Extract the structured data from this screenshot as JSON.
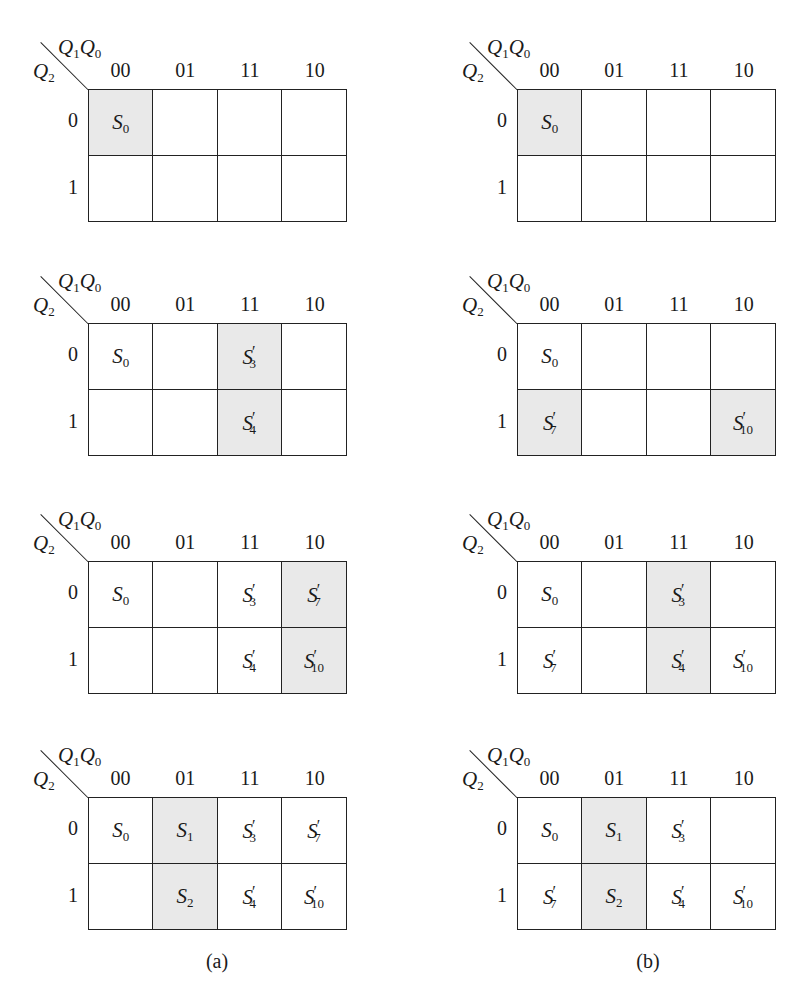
{
  "figure": {
    "column_variable": {
      "base": "Q",
      "parts": [
        {
          "letter": "Q",
          "sub": "1"
        },
        {
          "letter": "Q",
          "sub": "0"
        }
      ]
    },
    "row_variable": {
      "letter": "Q",
      "sub": "2"
    },
    "column_headers": [
      "00",
      "01",
      "11",
      "10"
    ],
    "row_headers": [
      "0",
      "1"
    ],
    "shade_color": "#e9e9e9",
    "captions": {
      "a": "(a)",
      "b": "(b)"
    }
  },
  "panels": [
    {
      "id": "a1",
      "column": "a",
      "step": 1,
      "cells": [
        [
          {
            "s": "S",
            "sub": "0",
            "prime": false,
            "shaded": true
          },
          {
            "s": "",
            "sub": "",
            "prime": false,
            "shaded": false
          },
          {
            "s": "",
            "sub": "",
            "prime": false,
            "shaded": false
          },
          {
            "s": "",
            "sub": "",
            "prime": false,
            "shaded": false
          }
        ],
        [
          {
            "s": "",
            "sub": "",
            "prime": false,
            "shaded": false
          },
          {
            "s": "",
            "sub": "",
            "prime": false,
            "shaded": false
          },
          {
            "s": "",
            "sub": "",
            "prime": false,
            "shaded": false
          },
          {
            "s": "",
            "sub": "",
            "prime": false,
            "shaded": false
          }
        ]
      ]
    },
    {
      "id": "b1",
      "column": "b",
      "step": 1,
      "cells": [
        [
          {
            "s": "S",
            "sub": "0",
            "prime": false,
            "shaded": true
          },
          {
            "s": "",
            "sub": "",
            "prime": false,
            "shaded": false
          },
          {
            "s": "",
            "sub": "",
            "prime": false,
            "shaded": false
          },
          {
            "s": "",
            "sub": "",
            "prime": false,
            "shaded": false
          }
        ],
        [
          {
            "s": "",
            "sub": "",
            "prime": false,
            "shaded": false
          },
          {
            "s": "",
            "sub": "",
            "prime": false,
            "shaded": false
          },
          {
            "s": "",
            "sub": "",
            "prime": false,
            "shaded": false
          },
          {
            "s": "",
            "sub": "",
            "prime": false,
            "shaded": false
          }
        ]
      ]
    },
    {
      "id": "a2",
      "column": "a",
      "step": 2,
      "cells": [
        [
          {
            "s": "S",
            "sub": "0",
            "prime": false,
            "shaded": false
          },
          {
            "s": "",
            "sub": "",
            "prime": false,
            "shaded": false
          },
          {
            "s": "S",
            "sub": "3",
            "prime": true,
            "shaded": true
          },
          {
            "s": "",
            "sub": "",
            "prime": false,
            "shaded": false
          }
        ],
        [
          {
            "s": "",
            "sub": "",
            "prime": false,
            "shaded": false
          },
          {
            "s": "",
            "sub": "",
            "prime": false,
            "shaded": false
          },
          {
            "s": "S",
            "sub": "4",
            "prime": true,
            "shaded": true
          },
          {
            "s": "",
            "sub": "",
            "prime": false,
            "shaded": false
          }
        ]
      ]
    },
    {
      "id": "b2",
      "column": "b",
      "step": 2,
      "cells": [
        [
          {
            "s": "S",
            "sub": "0",
            "prime": false,
            "shaded": false
          },
          {
            "s": "",
            "sub": "",
            "prime": false,
            "shaded": false
          },
          {
            "s": "",
            "sub": "",
            "prime": false,
            "shaded": false
          },
          {
            "s": "",
            "sub": "",
            "prime": false,
            "shaded": false
          }
        ],
        [
          {
            "s": "S",
            "sub": "7",
            "prime": true,
            "shaded": true
          },
          {
            "s": "",
            "sub": "",
            "prime": false,
            "shaded": false
          },
          {
            "s": "",
            "sub": "",
            "prime": false,
            "shaded": false
          },
          {
            "s": "S",
            "sub": "10",
            "prime": true,
            "shaded": true
          }
        ]
      ]
    },
    {
      "id": "a3",
      "column": "a",
      "step": 3,
      "cells": [
        [
          {
            "s": "S",
            "sub": "0",
            "prime": false,
            "shaded": false
          },
          {
            "s": "",
            "sub": "",
            "prime": false,
            "shaded": false
          },
          {
            "s": "S",
            "sub": "3",
            "prime": true,
            "shaded": false
          },
          {
            "s": "S",
            "sub": "7",
            "prime": true,
            "shaded": true
          }
        ],
        [
          {
            "s": "",
            "sub": "",
            "prime": false,
            "shaded": false
          },
          {
            "s": "",
            "sub": "",
            "prime": false,
            "shaded": false
          },
          {
            "s": "S",
            "sub": "4",
            "prime": true,
            "shaded": false
          },
          {
            "s": "S",
            "sub": "10",
            "prime": true,
            "shaded": true
          }
        ]
      ]
    },
    {
      "id": "b3",
      "column": "b",
      "step": 3,
      "cells": [
        [
          {
            "s": "S",
            "sub": "0",
            "prime": false,
            "shaded": false
          },
          {
            "s": "",
            "sub": "",
            "prime": false,
            "shaded": false
          },
          {
            "s": "S",
            "sub": "3",
            "prime": true,
            "shaded": true
          },
          {
            "s": "",
            "sub": "",
            "prime": false,
            "shaded": false
          }
        ],
        [
          {
            "s": "S",
            "sub": "7",
            "prime": true,
            "shaded": false
          },
          {
            "s": "",
            "sub": "",
            "prime": false,
            "shaded": false
          },
          {
            "s": "S",
            "sub": "4",
            "prime": true,
            "shaded": true
          },
          {
            "s": "S",
            "sub": "10",
            "prime": true,
            "shaded": false
          }
        ]
      ]
    },
    {
      "id": "a4",
      "column": "a",
      "step": 4,
      "cells": [
        [
          {
            "s": "S",
            "sub": "0",
            "prime": false,
            "shaded": false
          },
          {
            "s": "S",
            "sub": "1",
            "prime": false,
            "shaded": true
          },
          {
            "s": "S",
            "sub": "3",
            "prime": true,
            "shaded": false
          },
          {
            "s": "S",
            "sub": "7",
            "prime": true,
            "shaded": false
          }
        ],
        [
          {
            "s": "",
            "sub": "",
            "prime": false,
            "shaded": false
          },
          {
            "s": "S",
            "sub": "2",
            "prime": false,
            "shaded": true
          },
          {
            "s": "S",
            "sub": "4",
            "prime": true,
            "shaded": false
          },
          {
            "s": "S",
            "sub": "10",
            "prime": true,
            "shaded": false
          }
        ]
      ]
    },
    {
      "id": "b4",
      "column": "b",
      "step": 4,
      "cells": [
        [
          {
            "s": "S",
            "sub": "0",
            "prime": false,
            "shaded": false
          },
          {
            "s": "S",
            "sub": "1",
            "prime": false,
            "shaded": true
          },
          {
            "s": "S",
            "sub": "3",
            "prime": true,
            "shaded": false
          },
          {
            "s": "",
            "sub": "",
            "prime": false,
            "shaded": false
          }
        ],
        [
          {
            "s": "S",
            "sub": "7",
            "prime": true,
            "shaded": false
          },
          {
            "s": "S",
            "sub": "2",
            "prime": false,
            "shaded": true
          },
          {
            "s": "S",
            "sub": "4",
            "prime": true,
            "shaded": false
          },
          {
            "s": "S",
            "sub": "10",
            "prime": true,
            "shaded": false
          }
        ]
      ]
    }
  ]
}
